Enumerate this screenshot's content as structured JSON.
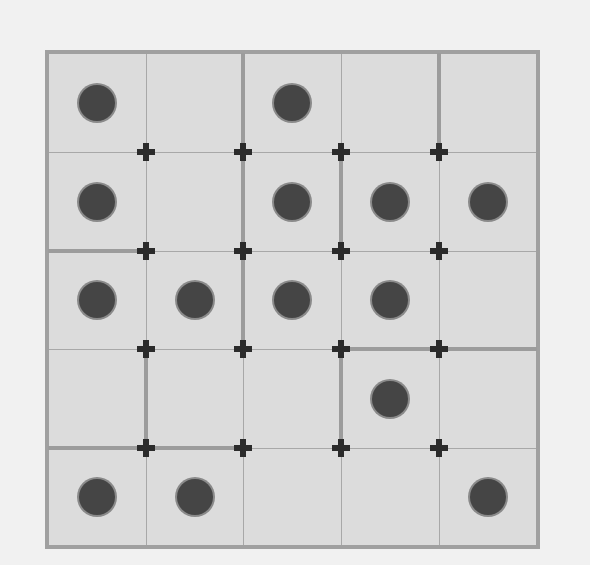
{
  "board": {
    "rows": 5,
    "cols": 5,
    "colors": {
      "background": "#f1f1f1",
      "cell": "#dcdcdc",
      "border": "#a0a0a0",
      "gridline": "#a8a8a8",
      "wall": "#9c9c9c",
      "stone": "#454545",
      "junction": "#2b2b2b"
    },
    "x_lines": [
      48,
      146,
      243,
      341,
      439,
      537
    ],
    "y_lines": [
      53,
      152,
      251,
      349,
      448,
      546
    ],
    "stones": [
      {
        "row": 0,
        "col": 0
      },
      {
        "row": 0,
        "col": 2
      },
      {
        "row": 1,
        "col": 0
      },
      {
        "row": 1,
        "col": 2
      },
      {
        "row": 1,
        "col": 3
      },
      {
        "row": 1,
        "col": 4
      },
      {
        "row": 2,
        "col": 0
      },
      {
        "row": 2,
        "col": 1
      },
      {
        "row": 2,
        "col": 2
      },
      {
        "row": 2,
        "col": 3
      },
      {
        "row": 3,
        "col": 3
      },
      {
        "row": 4,
        "col": 0
      },
      {
        "row": 4,
        "col": 1
      },
      {
        "row": 4,
        "col": 4
      }
    ],
    "walls_vertical": [
      {
        "line": 2,
        "row": 0
      },
      {
        "line": 2,
        "row": 1
      },
      {
        "line": 2,
        "row": 2
      },
      {
        "line": 3,
        "row": 1
      },
      {
        "line": 3,
        "row": 3
      },
      {
        "line": 4,
        "row": 0
      },
      {
        "line": 1,
        "row": 3
      }
    ],
    "walls_horizontal": [
      {
        "line": 2,
        "col": 0
      },
      {
        "line": 3,
        "col": 3
      },
      {
        "line": 3,
        "col": 4
      },
      {
        "line": 4,
        "col": 0
      },
      {
        "line": 4,
        "col": 1
      }
    ],
    "junction_icon": "cross-icon",
    "stone_icon": "stone-icon"
  }
}
